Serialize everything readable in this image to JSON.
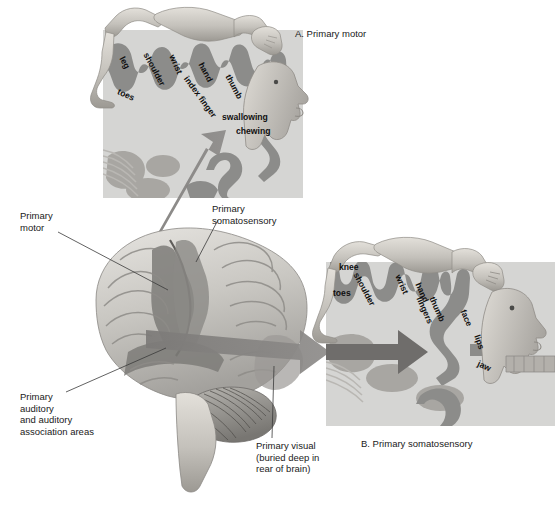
{
  "figure": {
    "panels": [
      {
        "id": "A",
        "label": "A. Primary motor"
      },
      {
        "id": "B",
        "label": "B. Primary somatosensory"
      }
    ]
  },
  "panel_a": {
    "caption": "A. Primary motor",
    "homunculus_labels": [
      {
        "text": "leg",
        "x": 122,
        "y": 52,
        "rot": 62
      },
      {
        "text": "shoulder",
        "x": 146,
        "y": 48,
        "rot": 62
      },
      {
        "text": "wrist",
        "x": 172,
        "y": 50,
        "rot": 66
      },
      {
        "text": "hand",
        "x": 201,
        "y": 58,
        "rot": 62
      },
      {
        "text": "index finger",
        "x": 186,
        "y": 72,
        "rot": 54
      },
      {
        "text": "thumb",
        "x": 228,
        "y": 70,
        "rot": 62
      },
      {
        "text": "toes",
        "x": 118,
        "y": 86,
        "rot": 24
      },
      {
        "text": "swallowing",
        "x": 222,
        "y": 112,
        "rot": 0
      },
      {
        "text": "chewing",
        "x": 236,
        "y": 126,
        "rot": 0
      }
    ]
  },
  "panel_b": {
    "caption": "B. Primary somatosensory",
    "homunculus_labels": [
      {
        "text": "knee",
        "x": 339,
        "y": 262,
        "rot": 0
      },
      {
        "text": "shoulder",
        "x": 356,
        "y": 268,
        "rot": 62
      },
      {
        "text": "toes",
        "x": 333,
        "y": 288,
        "rot": 0
      },
      {
        "text": "wrist",
        "x": 398,
        "y": 270,
        "rot": 66
      },
      {
        "text": "hand",
        "x": 418,
        "y": 278,
        "rot": 66
      },
      {
        "text": "fingers",
        "x": 419,
        "y": 292,
        "rot": 66
      },
      {
        "text": "thumb",
        "x": 432,
        "y": 292,
        "rot": 66
      },
      {
        "text": "face",
        "x": 463,
        "y": 305,
        "rot": 66
      },
      {
        "text": "lips",
        "x": 477,
        "y": 330,
        "rot": 70
      },
      {
        "text": "jaw",
        "x": 478,
        "y": 358,
        "rot": 24
      }
    ]
  },
  "brain_labels": [
    {
      "id": "primary-motor",
      "lines": "Primary\nmotor",
      "x": 20,
      "y": 215
    },
    {
      "id": "primary-somatosensory",
      "lines": "Primary\nsomatosensory",
      "x": 212,
      "y": 208
    },
    {
      "id": "primary-auditory",
      "lines": "Primary\nauditory\nand auditory\nassociation areas",
      "x": 20,
      "y": 396
    },
    {
      "id": "primary-visual",
      "lines": "Primary visual\n(buried deep in\nrear of brain)",
      "x": 258,
      "y": 444
    }
  ],
  "colors": {
    "background": "#ffffff",
    "panel_fill": "#d5d5d3",
    "cortex_ribbon": "#8c8c8a",
    "cortex_ribbon_dark": "#6f6f6d",
    "brain_light": "#d8d6d2",
    "brain_mid": "#a9a7a3",
    "brain_dark": "#7d7b78",
    "arrow": "#7e7c7a",
    "homunculus": "#c9c6c0",
    "leader_line": "#3a3a3a",
    "text": "#1a1a1a"
  }
}
